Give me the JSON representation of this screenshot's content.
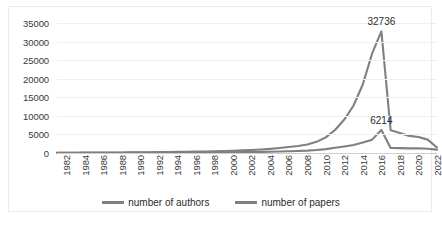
{
  "chart_data": {
    "type": "line",
    "title": "",
    "xlabel": "",
    "ylabel": "",
    "grid": true,
    "legend_position": "bottom",
    "ylim": [
      0,
      35000
    ],
    "y_ticks": [
      0,
      5000,
      10000,
      15000,
      20000,
      25000,
      30000,
      35000
    ],
    "y_tick_labels": [
      "0",
      "5000",
      "10000",
      "15000",
      "20000",
      "25000",
      "30000",
      "35000"
    ],
    "x": [
      1982,
      1983,
      1984,
      1985,
      1986,
      1987,
      1988,
      1989,
      1990,
      1991,
      1992,
      1993,
      1994,
      1995,
      1996,
      1997,
      1998,
      1999,
      2000,
      2001,
      2002,
      2003,
      2004,
      2005,
      2006,
      2007,
      2008,
      2009,
      2010,
      2011,
      2012,
      2013,
      2014,
      2015,
      2016,
      2017,
      2018,
      2019,
      2020,
      2021,
      2022,
      2023
    ],
    "x_tick_labels": [
      "1982",
      "1984",
      "1986",
      "1988",
      "1990",
      "1992",
      "1994",
      "1996",
      "1998",
      "2000",
      "2002",
      "2004",
      "2006",
      "2008",
      "2010",
      "2012",
      "2014",
      "2016",
      "2018",
      "2020",
      "2022"
    ],
    "series": [
      {
        "name": "number of authors",
        "color": "#808080",
        "values": [
          60,
          70,
          80,
          95,
          110,
          120,
          140,
          150,
          170,
          190,
          210,
          240,
          260,
          290,
          330,
          370,
          420,
          470,
          540,
          600,
          700,
          800,
          950,
          1100,
          1350,
          1600,
          1900,
          2300,
          3000,
          4200,
          6200,
          9000,
          12800,
          18500,
          26800,
          32736,
          6100,
          5400,
          4600,
          4300,
          3600,
          1500
        ]
      },
      {
        "name": "number of papers",
        "color": "#808080",
        "values": [
          40,
          45,
          50,
          55,
          62,
          68,
          75,
          82,
          90,
          98,
          108,
          118,
          128,
          140,
          152,
          165,
          180,
          195,
          215,
          235,
          260,
          285,
          315,
          350,
          400,
          460,
          540,
          640,
          800,
          1050,
          1400,
          1750,
          2150,
          2800,
          3600,
          6214,
          1350,
          1300,
          1250,
          1280,
          1150,
          900
        ]
      }
    ],
    "annotations": [
      {
        "text": "32736",
        "series": "number of authors",
        "x": 2017,
        "y": 32736
      },
      {
        "text": "6214",
        "series": "number of papers",
        "x": 2017,
        "y": 6214
      }
    ]
  },
  "legend": {
    "entries": [
      {
        "label": "number of authors"
      },
      {
        "label": "number of papers"
      }
    ]
  }
}
